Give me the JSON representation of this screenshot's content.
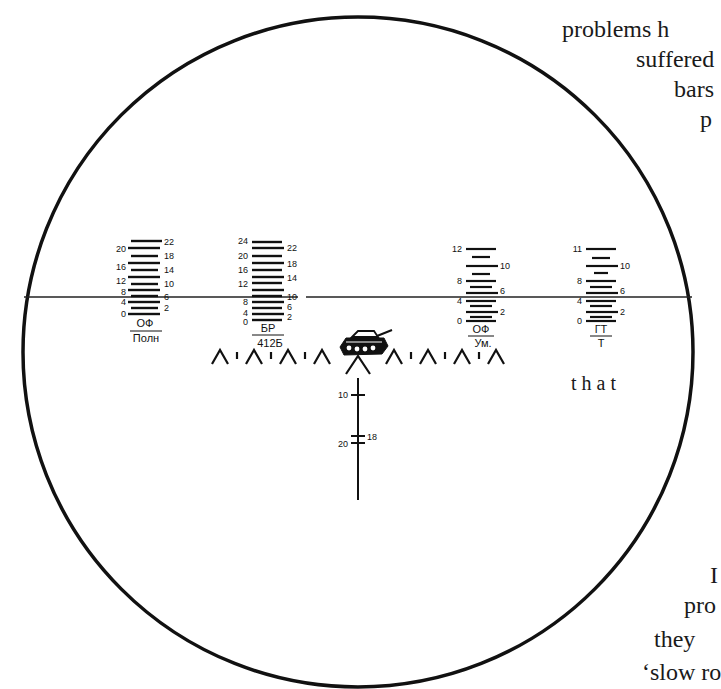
{
  "figure": {
    "type": "gunsight-reticle",
    "circle": {
      "cx": 358,
      "cy": 352,
      "r": 335,
      "stroke": "#111111"
    },
    "horizon_line_y": 297,
    "scales": [
      {
        "id": "of-poln",
        "x": 118,
        "left_labels": [
          "20",
          "16",
          "12",
          "8",
          "4",
          "0"
        ],
        "right_labels": [
          "22",
          "18",
          "14",
          "10",
          "6",
          "2"
        ],
        "top_label": "ОФ",
        "bottom_label": "Полн"
      },
      {
        "id": "br-412b",
        "x": 240,
        "left_labels": [
          "24",
          "20",
          "16",
          "12",
          "8",
          "4",
          "0"
        ],
        "right_labels": [
          "22",
          "18",
          "14",
          "10",
          "6",
          "2"
        ],
        "top_label": "БР",
        "bottom_label": "412Б"
      },
      {
        "id": "of-um",
        "x": 458,
        "left_labels": [
          "12",
          "8",
          "4",
          "0"
        ],
        "right_labels": [
          "10",
          "6",
          "2"
        ],
        "top_label": "ОФ",
        "bottom_label": "Ум."
      },
      {
        "id": "gt-t",
        "x": 580,
        "left_labels": [
          "11",
          "8",
          "4",
          "0"
        ],
        "right_labels": [
          "10",
          "6",
          "2"
        ],
        "top_label": "ГТ",
        "bottom_label": "Т"
      }
    ],
    "vertical_scale": {
      "labels_left": [
        "10",
        "20"
      ],
      "labels_right": [
        "18"
      ]
    },
    "center_mark": "tank-silhouette"
  },
  "body_text": {
    "line1": "problems h",
    "line2": "suffered",
    "line3": "bars",
    "line4": "p",
    "line5": "that",
    "line6": "I",
    "line7": "pro",
    "line8": "they",
    "line9": "‘slow ro"
  }
}
